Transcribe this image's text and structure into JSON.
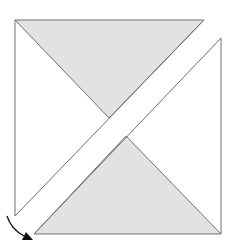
{
  "diagram": {
    "type": "fold-diagram",
    "colors": {
      "background": "#ffffff",
      "shaded": "#e2e2e2",
      "line": "#707070",
      "arrow": "#111111"
    },
    "shapes": {
      "outer_left_piece": "15,20 15,216 109,118",
      "top_triangle": "15,20 204,20 109,118",
      "diagonal_strip_edge_upper": "204,20 15,216",
      "diagonal_strip_edge_lower": "221,38 34,234",
      "right_piece": "221,38 221,234 126,136",
      "bottom_triangle": "34,234 221,234 126,136"
    },
    "arrow": {
      "path": "M7,216 Q12,230 28,238",
      "direction": "clockwise-fold"
    }
  }
}
